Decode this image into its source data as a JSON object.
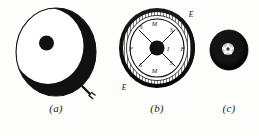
{
  "figure": {
    "background_color": "#fdfdfb",
    "ink_color": "#111111",
    "panels": [
      {
        "id": "a",
        "caption": "(a)",
        "description": "crescent-shaded sphere with central dot and pointer arrow",
        "annotations": [],
        "pointer": {
          "present": true,
          "name": "pointer-arrow"
        }
      },
      {
        "id": "b",
        "caption": "(b)",
        "description": "ribbed annular ring with spoked inner dial and lettered markings",
        "annotations": [
          {
            "text": "E",
            "position": "outer-upper-right"
          },
          {
            "text": "E",
            "position": "outer-lower-left"
          },
          {
            "text": "M",
            "position": "inner-top"
          },
          {
            "text": "M",
            "position": "inner-bottom"
          },
          {
            "text": "S",
            "position": "inner-upper-left"
          },
          {
            "text": "S",
            "position": "inner-upper-right"
          },
          {
            "text": "S",
            "position": "inner-lower-left"
          },
          {
            "text": "S",
            "position": "inner-lower-right"
          },
          {
            "text": "F",
            "position": "inner-left"
          },
          {
            "text": "F",
            "position": "inner-right"
          },
          {
            "text": "I",
            "position": "hub-right"
          }
        ]
      },
      {
        "id": "c",
        "caption": "(c)",
        "description": "small dark disc with light stellate center",
        "annotations": []
      }
    ]
  },
  "captions": {
    "a": "(a)",
    "b": "(b)",
    "c": "(c)"
  },
  "labels_b": {
    "e_top": "E",
    "e_bottom": "E",
    "m_top": "M",
    "m_bottom": "M",
    "s_ul": "S",
    "s_ur": "S",
    "s_ll": "S",
    "s_lr": "S",
    "f_left": "F",
    "f_right": "F",
    "i_hub": "I"
  }
}
